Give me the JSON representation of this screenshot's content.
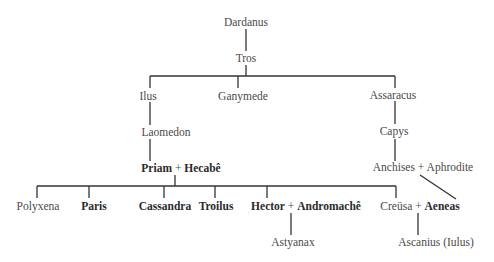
{
  "diagram": {
    "type": "family-tree",
    "nodes": {
      "dardanus": "Dardanus",
      "tros": "Tros",
      "ilus": "Ilus",
      "ganymede": "Ganymede",
      "assaracus": "Assaracus",
      "laomedon": "Laomedon",
      "capys": "Capys",
      "priam": "Priam",
      "hecabe": "Hecabê",
      "anchises": "Anchises",
      "aphrodite": "Aphrodite",
      "polyxena": "Polyxena",
      "paris": "Paris",
      "cassandra": "Cassandra",
      "troilus": "Troilus",
      "hector": "Hector",
      "andromache": "Andromachê",
      "creusa": "Creüsa",
      "aeneas": "Aeneas",
      "astyanax": "Astyanax",
      "ascanius": "Ascanius (Iulus)"
    },
    "plus": "+",
    "bold_names": [
      "Priam",
      "Hecabê",
      "Paris",
      "Cassandra",
      "Troilus",
      "Hector",
      "Andromachê",
      "Aeneas"
    ],
    "edges": [
      [
        "Dardanus",
        "Tros"
      ],
      [
        "Tros",
        "Ilus"
      ],
      [
        "Tros",
        "Ganymede"
      ],
      [
        "Tros",
        "Assaracus"
      ],
      [
        "Ilus",
        "Laomedon"
      ],
      [
        "Laomedon",
        "Priam + Hecabê"
      ],
      [
        "Assaracus",
        "Capys"
      ],
      [
        "Capys",
        "Anchises + Aphrodite"
      ],
      [
        "Anchises + Aphrodite",
        "Aeneas"
      ],
      [
        "Priam + Hecabê",
        "Polyxena"
      ],
      [
        "Priam + Hecabê",
        "Paris"
      ],
      [
        "Priam + Hecabê",
        "Cassandra"
      ],
      [
        "Priam + Hecabê",
        "Troilus"
      ],
      [
        "Priam + Hecabê",
        "Hector"
      ],
      [
        "Priam + Hecabê",
        "Creüsa"
      ],
      [
        "Hector + Andromachê",
        "Astyanax"
      ],
      [
        "Creüsa + Aeneas",
        "Ascanius (Iulus)"
      ]
    ],
    "line_color": "#333333",
    "text_color": "#4a4a4a"
  }
}
